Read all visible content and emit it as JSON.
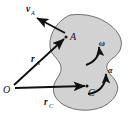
{
  "figure": {
    "body_fill": "#d2d2d2",
    "body_stroke": "#6e6e6e",
    "vector_color": "#111111",
    "background": "#ffffff"
  },
  "points": [
    {
      "id": "O",
      "label": "O",
      "x": 10,
      "y": 88,
      "role": "origin"
    },
    {
      "id": "A",
      "label": "A",
      "x": 67,
      "y": 36,
      "role": "body-point"
    },
    {
      "id": "C",
      "label": "C",
      "x": 89,
      "y": 88,
      "role": "mass-center"
    }
  ],
  "vectors": [
    {
      "id": "r_A",
      "symbol": "r",
      "subscript": "A",
      "label_x": 33,
      "label_y": 62,
      "from": "O",
      "to": "A",
      "kind": "position"
    },
    {
      "id": "r_C",
      "symbol": "r",
      "subscript": "C",
      "label_x": 46,
      "label_y": 104,
      "from": "O",
      "to": "C",
      "kind": "position"
    },
    {
      "id": "v_A",
      "symbol": "v",
      "subscript": "A",
      "label_x": 28,
      "label_y": 12,
      "from": "A",
      "to": "tip",
      "kind": "velocity"
    }
  ],
  "rotation_symbols": [
    {
      "id": "omega",
      "glyph": "ω",
      "label_x": 101,
      "label_y": 47,
      "kind": "angular-velocity",
      "arrow": "curved-ccw"
    },
    {
      "id": "alpha",
      "glyph": "α",
      "label_x": 110,
      "label_y": 72,
      "kind": "angular-acceleration",
      "arrow": "curved-ccw"
    }
  ]
}
